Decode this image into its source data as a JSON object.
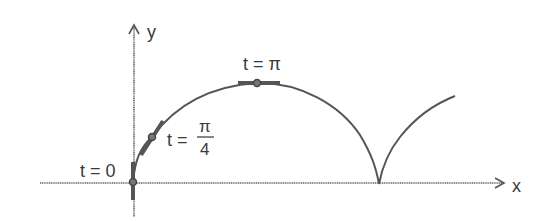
{
  "diagram": {
    "axes": {
      "x_label": "x",
      "y_label": "y"
    },
    "labels": {
      "t0": "t = 0",
      "t_pi4_prefix": "t =",
      "t_pi4_num": "π",
      "t_pi4_den": "4",
      "t_pi": "t = π"
    },
    "points": [
      {
        "name": "t=0",
        "t": "0",
        "x": 133,
        "y": 182
      },
      {
        "name": "t=pi/4",
        "t": "π/4",
        "x": 152,
        "y": 137
      },
      {
        "name": "t=pi",
        "t": "π",
        "x": 257,
        "y": 83
      }
    ],
    "colors": {
      "curve": "#555555",
      "axis": "#6a6a6a",
      "text": "#3a3a3a"
    }
  }
}
